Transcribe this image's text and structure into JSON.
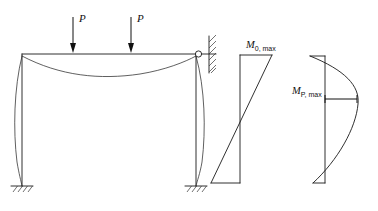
{
  "figure": {
    "kind": "structural-engineering-diagram",
    "background_color": "#ffffff",
    "line_color": "#1a1a1a"
  },
  "frame": {
    "name": "portal-frame",
    "loads": [
      {
        "label": "P",
        "x": 73,
        "arrow_top": 17,
        "arrow_bottom": 50
      },
      {
        "label": "P",
        "x": 131,
        "arrow_top": 17,
        "arrow_bottom": 50
      }
    ],
    "beam": {
      "left_x": 22,
      "right_x": 196,
      "y": 54
    },
    "columns": [
      {
        "name": "left-column",
        "x": 22,
        "top_y": 54,
        "base_y": 186
      },
      {
        "name": "right-column",
        "x": 196,
        "top_y": 54,
        "base_y": 186
      }
    ],
    "supports": [
      {
        "name": "left-fixed-support",
        "x": 22,
        "y": 186,
        "type": "fixed-hatched"
      },
      {
        "name": "right-fixed-support",
        "x": 196,
        "y": 186,
        "type": "fixed-hatched"
      }
    ],
    "pin_node": {
      "name": "pin-connection",
      "x": 198,
      "y": 54,
      "radius": 3.0
    },
    "wall": {
      "name": "hatched-wall",
      "x": 208,
      "top_y": 36,
      "bottom_y": 72
    },
    "deflected_shape_note": "beam sags downward, columns bow outward"
  },
  "diagram_m0": {
    "name": "moment-diagram-m0",
    "label": "M",
    "subscript": "0, max",
    "label_x": 246,
    "label_y": 47,
    "baseline_x": 240,
    "top_y": 55,
    "bottom_y": 183,
    "top_right_x": 272,
    "bottom_left_x": 211,
    "type": "linear-antisymmetric"
  },
  "diagram_mp": {
    "name": "moment-diagram-mp",
    "label": "M",
    "subscript": "P, max",
    "label_x": 299,
    "label_y": 93,
    "baseline_x": 325,
    "top_y": 56,
    "bottom_y": 183,
    "top_left_x": 310,
    "peak_x": 358,
    "peak_y": 99,
    "dimension_line": {
      "x1": 325,
      "x2": 357,
      "y": 99
    },
    "type": "parabolic"
  },
  "symbols": {
    "load_label": "P",
    "moment_zero_label": "M",
    "moment_zero_sub": "0, max",
    "moment_p_label": "M",
    "moment_p_sub": "P, max"
  }
}
